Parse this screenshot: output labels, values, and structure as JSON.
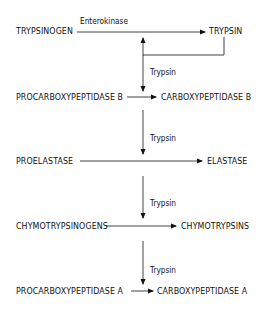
{
  "diagram": {
    "type": "activation-cascade",
    "rows": [
      {
        "substrate": "TRYPSINOGEN",
        "product": "TRYPSIN",
        "enzyme": "Enterokinase"
      },
      {
        "substrate": "PROCARBOXYPEPTIDASE B",
        "product": "CARBOXYPEPTIDASE B",
        "enzyme": "Trypsin"
      },
      {
        "substrate": "PROELASTASE",
        "product": "ELASTASE",
        "enzyme": "Trypsin"
      },
      {
        "substrate": "CHYMOTRYPSINOGENS",
        "product": "CHYMOTRYPSINS",
        "enzyme": "Trypsin"
      },
      {
        "substrate": "PROCARBOXYPEPTIDASE A",
        "product": "CARBOXYPEPTIDASE A",
        "enzyme": "Trypsin"
      }
    ],
    "line_color": "#111111",
    "background": "#ffffff"
  }
}
